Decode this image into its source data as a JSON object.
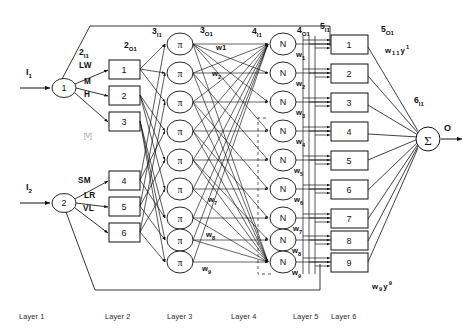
{
  "figure": {
    "stroke_color": "#111111",
    "text_color": "#1a1a1a",
    "background": "#ffffff"
  },
  "inputs": [
    {
      "label": "I",
      "sub": "1",
      "node": "1"
    },
    {
      "label": "I",
      "sub": "2",
      "node": "2"
    }
  ],
  "output": {
    "node": "Σ",
    "label": "O"
  },
  "stage_tags": [
    {
      "id": "2I1",
      "base": "2",
      "sub": "I1"
    },
    {
      "id": "2O1",
      "base": "2",
      "sub": "O1"
    },
    {
      "id": "3I1",
      "base": "3",
      "sub": "I1"
    },
    {
      "id": "3O1",
      "base": "3",
      "sub": "O1"
    },
    {
      "id": "4I1",
      "base": "4",
      "sub": "I1"
    },
    {
      "id": "4O1",
      "base": "4",
      "sub": "O1"
    },
    {
      "id": "5I1",
      "base": "5",
      "sub": "I1"
    },
    {
      "id": "5O1",
      "base": "5",
      "sub": "O1"
    },
    {
      "id": "6I1",
      "base": "6",
      "sub": "I1"
    }
  ],
  "membership_labels_input1": [
    "LW",
    "M",
    "H"
  ],
  "membership_labels_input2": [
    "SM",
    "LR",
    "VL"
  ],
  "vee_marker": "[V]",
  "layer2_nodes": [
    "1",
    "2",
    "3",
    "4",
    "5",
    "6"
  ],
  "layer3_nodes": [
    "π",
    "π",
    "π",
    "π",
    "π",
    "π",
    "π",
    "π",
    "π"
  ],
  "layer4_nodes": [
    "N",
    "N",
    "N",
    "N",
    "N",
    "N",
    "N",
    "N",
    "N"
  ],
  "layer5_nodes": [
    "1",
    "2",
    "3",
    "4",
    "5",
    "6",
    "7",
    "8",
    "9"
  ],
  "rule_weights": [
    {
      "base": "w",
      "sub": "1",
      "text": "w1"
    },
    {
      "base": "w",
      "sub": "2",
      "text": "w2"
    },
    {
      "base": "w",
      "sub": "3",
      "text": "w3"
    },
    {
      "base": "w",
      "sub": "4",
      "text": "w4"
    },
    {
      "base": "w",
      "sub": "5",
      "text": "w5"
    },
    {
      "base": "w",
      "sub": "6",
      "text": "w6"
    },
    {
      "base": "w",
      "sub": "7",
      "text": "w7"
    },
    {
      "base": "w",
      "sub": "8",
      "text": "w8"
    },
    {
      "base": "w",
      "sub": "9",
      "text": "w9"
    }
  ],
  "normalized_weights": [
    {
      "base": "w",
      "sub": "1",
      "text": "w1"
    },
    {
      "base": "w",
      "sub": "2",
      "text": "w2"
    },
    {
      "base": "w",
      "sub": "3",
      "text": "w3"
    },
    {
      "base": "w",
      "sub": "4",
      "text": "w4"
    },
    {
      "base": "w",
      "sub": "5",
      "text": "w5"
    },
    {
      "base": "w",
      "sub": "6",
      "text": "w6"
    },
    {
      "base": "w",
      "sub": "7",
      "text": "w7"
    },
    {
      "base": "w",
      "sub": "8",
      "text": "w8"
    },
    {
      "base": "w",
      "sub": "9",
      "text": "w9"
    }
  ],
  "consequent_terms": [
    {
      "base": "w",
      "sub1": "1",
      "mid": "y",
      "sup": "1"
    },
    {
      "base": "w",
      "sub1": "9",
      "mid": "y",
      "sup": "9"
    }
  ],
  "layer_captions": [
    "Layer 1",
    "Layer 2",
    "Layer 3",
    "Layer 4",
    "Layer 5",
    "Layer 6"
  ]
}
